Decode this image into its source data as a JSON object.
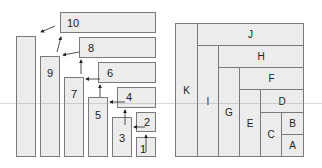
{
  "left_diagram": {
    "title": "",
    "horizontal_boxes": [
      {
        "label": "10"
      },
      {
        "label": "8"
      },
      {
        "label": "6"
      },
      {
        "label": "4"
      },
      {
        "label": "2"
      }
    ],
    "vertical_boxes": [
      {
        "label": "1"
      },
      {
        "label": "3"
      },
      {
        "label": "5"
      },
      {
        "label": "7"
      },
      {
        "label": "9"
      },
      {
        "label": ""
      }
    ],
    "arrow_sequence": [
      "1→2",
      "2→3",
      "3→4",
      "4→5",
      "5→6",
      "6→7",
      "7→8",
      "8→9",
      "9→10",
      "10→tall"
    ]
  },
  "right_diagram": {
    "cells": [
      {
        "label": "K"
      },
      {
        "label": "J"
      },
      {
        "label": "I"
      },
      {
        "label": "H"
      },
      {
        "label": "G"
      },
      {
        "label": "F"
      },
      {
        "label": "E"
      },
      {
        "label": "D"
      },
      {
        "label": "C"
      },
      {
        "label": "B"
      },
      {
        "label": "A"
      }
    ]
  },
  "colors": {
    "fill": "#ececec",
    "stroke": "#7a7a7a",
    "text": "#222222"
  }
}
